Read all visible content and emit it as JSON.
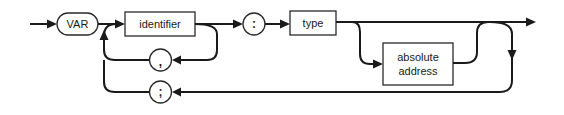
{
  "diagram": {
    "type": "syntax-railroad",
    "terminals": {
      "var": "VAR",
      "colon": ":",
      "comma": ",",
      "semicolon": ";"
    },
    "nonterminals": {
      "identifier": "identifier",
      "type": "type",
      "absolute_address_line1": "absolute",
      "absolute_address_line2": "address"
    },
    "colors": {
      "stroke": "#1a1a1a",
      "background": "#ffffff"
    }
  }
}
